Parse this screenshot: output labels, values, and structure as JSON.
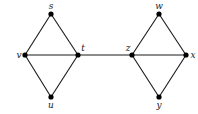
{
  "diagram": {
    "type": "graph",
    "width": 198,
    "height": 114,
    "colors": {
      "edge": "#1a1a1a",
      "node": "#000000",
      "background": "#ffffff"
    },
    "nodes": [
      {
        "id": "s",
        "label": "s",
        "x": 51,
        "y": 14,
        "lx": 51,
        "ly": 9,
        "anchor": "middle"
      },
      {
        "id": "v",
        "label": "v",
        "x": 25,
        "y": 55,
        "lx": 19,
        "ly": 58,
        "anchor": "middle"
      },
      {
        "id": "t",
        "label": "t",
        "x": 78,
        "y": 55,
        "lx": 83,
        "ly": 51,
        "anchor": "middle"
      },
      {
        "id": "u",
        "label": "u",
        "x": 51,
        "y": 97,
        "lx": 51,
        "ly": 108,
        "anchor": "middle"
      },
      {
        "id": "z",
        "label": "z",
        "x": 132,
        "y": 55,
        "lx": 128,
        "ly": 51,
        "anchor": "middle"
      },
      {
        "id": "w",
        "label": "w",
        "x": 159,
        "y": 14,
        "lx": 159,
        "ly": 9,
        "anchor": "middle"
      },
      {
        "id": "x",
        "label": "x",
        "x": 186,
        "y": 55,
        "lx": 193,
        "ly": 58,
        "anchor": "middle"
      },
      {
        "id": "y",
        "label": "y",
        "x": 159,
        "y": 97,
        "lx": 159,
        "ly": 108,
        "anchor": "middle"
      }
    ],
    "edges": [
      [
        "s",
        "v"
      ],
      [
        "s",
        "t"
      ],
      [
        "v",
        "t"
      ],
      [
        "v",
        "u"
      ],
      [
        "u",
        "t"
      ],
      [
        "t",
        "z"
      ],
      [
        "z",
        "w"
      ],
      [
        "w",
        "x"
      ],
      [
        "z",
        "x"
      ],
      [
        "z",
        "y"
      ],
      [
        "y",
        "x"
      ]
    ]
  }
}
